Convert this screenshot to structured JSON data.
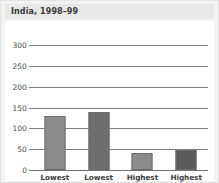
{
  "figure": {
    "title": "India, 1998–99",
    "background_color": "#f3f3f3",
    "plot_background_color": "#ffffff",
    "title_bar_color": "#e8e8e8"
  },
  "chart_data": {
    "type": "bar",
    "title": "India, 1998–99",
    "xlabel": "",
    "ylabel": "",
    "categories": [
      "Lowest urban",
      "Lowest rural",
      "Highest urban",
      "Highest rural"
    ],
    "category_lines": [
      [
        "Lowest",
        "urban"
      ],
      [
        "Lowest",
        "rural"
      ],
      [
        "Highest",
        "urban"
      ],
      [
        "Highest",
        "rural"
      ]
    ],
    "values": [
      130,
      140,
      42,
      47
    ],
    "bar_colors": [
      "#8c8c8c",
      "#6e6e6e",
      "#8c8c8c",
      "#5a5a5a"
    ],
    "ylim": [
      0,
      300
    ],
    "yticks": [
      0,
      50,
      100,
      150,
      200,
      250,
      300
    ],
    "ytick_labels": [
      "0",
      "50",
      "100",
      "150",
      "200",
      "250",
      "300"
    ],
    "grid": true,
    "grid_axis": "y",
    "legend": false,
    "legend_position": "none"
  }
}
